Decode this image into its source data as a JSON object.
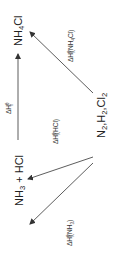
{
  "diagram": {
    "orientation": "rotated-90-ccw",
    "nodes": {
      "product": {
        "base": "NH",
        "sub": "4",
        "tail": "Cl"
      },
      "intermediates": {
        "a": "NH",
        "a_sub": "3",
        "b": " + HCl"
      },
      "elements": {
        "n": "N",
        "n_sub": "2",
        "h": ",H",
        "h_sub": "2",
        "cl": ",Cl",
        "cl_sub": "2"
      }
    },
    "edges": {
      "reaction": {
        "delta": "ΔH",
        "sub": "r",
        "sup": "θ"
      },
      "formation_nh4cl": {
        "delta": "ΔH",
        "sup": "θ",
        "sub": "f",
        "species": "(NH",
        "species_sub": "4",
        "species_tail": "Cl)"
      },
      "formation_hcl": {
        "delta": "ΔH",
        "sup": "θ",
        "sub": "f",
        "species": "(HCl)"
      },
      "formation_nh3": {
        "delta": "ΔH",
        "sup": "θ",
        "sub": "f",
        "species": "(NH",
        "species_sub": "3",
        "species_tail": ")"
      }
    },
    "colors": {
      "text": "#222222",
      "line": "#333333",
      "background": "#ffffff"
    }
  }
}
